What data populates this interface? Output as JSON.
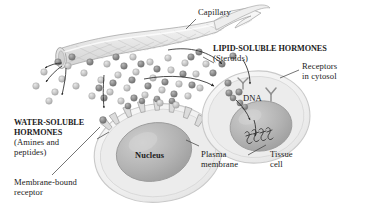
{
  "figure": {
    "kind": "biology-illustration",
    "background_color": "#ffffff"
  },
  "labels": {
    "capillary": "Capillary",
    "lipid_soluble_title": "LIPID-SOLUBLE HORMONES",
    "lipid_soluble_sub": "(Steroids)",
    "receptors_line1": "Receptors",
    "receptors_line2": "in cytosol",
    "dna": "DNA",
    "water_soluble_line1": "WATER-SOLUBLE",
    "water_soluble_line2": "HORMONES",
    "water_soluble_line3": "(Amines and",
    "water_soluble_line4": "peptides)",
    "nucleus": "Nucleus",
    "plasma_line1": "Plasma",
    "plasma_line2": "membrane",
    "tissue_line1": "Tissue",
    "tissue_line2": "cell",
    "membrane_bound_line1": "Membrane-bound",
    "membrane_bound_line2": "receptor"
  },
  "colors": {
    "ink": "#1b1b1b",
    "leader": "#3a3a3a",
    "capillary_fill": "#ededed",
    "capillary_edge": "#a8a8a8",
    "capillary_mesh": "#bdbdbd",
    "cell_fill": "#f2f2f2",
    "cell_edge": "#c9c9c9",
    "cytosol_fill": "#e6e6e6",
    "nucleus_fill": "#b5b5b5",
    "nucleus_edge": "#9a9a9a",
    "hormone_light": "#c4c4c4",
    "hormone_dark": "#8a8a8a",
    "receptor_fill": "#dcdcdc",
    "receptor_edge": "#9e9e9e",
    "arrow": "#2b2b2b"
  },
  "elements": {
    "capillary_desc": "branching blood vessel with mesh texture, cut open at lower-left end",
    "left_cell_desc": "tissue cell with membrane-bound receptors on its surface and a large nucleus",
    "right_cell_desc": "tissue cell with cytosolic receptors, hormone-receptor complex entering nucleus to DNA",
    "hormone_count_light": 31,
    "hormone_count_dark": 24,
    "membrane_receptor_count": 6,
    "arrow_count": 7
  },
  "hormones_light": [
    {
      "x": 44,
      "y": 72
    },
    {
      "x": 36,
      "y": 86
    },
    {
      "x": 55,
      "y": 92
    },
    {
      "x": 68,
      "y": 66
    },
    {
      "x": 62,
      "y": 79
    },
    {
      "x": 49,
      "y": 101
    },
    {
      "x": 76,
      "y": 86
    },
    {
      "x": 84,
      "y": 73
    },
    {
      "x": 92,
      "y": 96
    },
    {
      "x": 101,
      "y": 80
    },
    {
      "x": 110,
      "y": 92
    },
    {
      "x": 118,
      "y": 75
    },
    {
      "x": 127,
      "y": 88
    },
    {
      "x": 136,
      "y": 72
    },
    {
      "x": 145,
      "y": 95
    },
    {
      "x": 153,
      "y": 78
    },
    {
      "x": 162,
      "y": 90
    },
    {
      "x": 171,
      "y": 70
    },
    {
      "x": 179,
      "y": 84
    },
    {
      "x": 188,
      "y": 96
    },
    {
      "x": 196,
      "y": 74
    },
    {
      "x": 150,
      "y": 62
    },
    {
      "x": 133,
      "y": 57
    },
    {
      "x": 168,
      "y": 58
    },
    {
      "x": 185,
      "y": 63
    },
    {
      "x": 107,
      "y": 64
    },
    {
      "x": 121,
      "y": 101
    },
    {
      "x": 160,
      "y": 103
    },
    {
      "x": 176,
      "y": 105
    },
    {
      "x": 200,
      "y": 88
    },
    {
      "x": 206,
      "y": 64
    }
  ],
  "hormones_dark": [
    {
      "x": 58,
      "y": 62
    },
    {
      "x": 72,
      "y": 57
    },
    {
      "x": 90,
      "y": 62
    },
    {
      "x": 99,
      "y": 88
    },
    {
      "x": 113,
      "y": 83
    },
    {
      "x": 124,
      "y": 66
    },
    {
      "x": 132,
      "y": 80
    },
    {
      "x": 141,
      "y": 64
    },
    {
      "x": 148,
      "y": 86
    },
    {
      "x": 157,
      "y": 69
    },
    {
      "x": 165,
      "y": 82
    },
    {
      "x": 174,
      "y": 94
    },
    {
      "x": 183,
      "y": 74
    },
    {
      "x": 192,
      "y": 85
    },
    {
      "x": 116,
      "y": 57
    },
    {
      "x": 104,
      "y": 98
    },
    {
      "x": 134,
      "y": 98
    },
    {
      "x": 191,
      "y": 57
    },
    {
      "x": 199,
      "y": 52
    },
    {
      "x": 213,
      "y": 73
    },
    {
      "x": 222,
      "y": 64
    },
    {
      "x": 233,
      "y": 56
    },
    {
      "x": 228,
      "y": 83
    },
    {
      "x": 239,
      "y": 92
    }
  ]
}
